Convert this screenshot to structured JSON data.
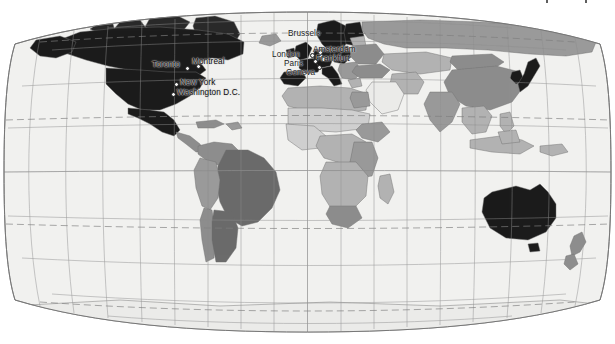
{
  "figure": {
    "type": "world-map",
    "projection": "robinson",
    "title": "",
    "background_color": "#ffffff",
    "ocean_color": "#f1f1ef",
    "graticule_color": "#8e8e8e",
    "tropic_line_color": "#8a8a8a",
    "tropic_line_style": "dashed",
    "outline_color": "#777777",
    "border_color": "#6f6f6f",
    "width": 615,
    "height": 344
  },
  "legend_shades": {
    "highlight_dark": "#1d1d1d",
    "tier_2": "#6b6b6b",
    "tier_3": "#8f8f8f",
    "tier_4": "#b3b3b3",
    "tier_5": "#cfcfcf",
    "tier_6": "#e4e4e2",
    "unshaded": "#f1f1ef"
  },
  "graticule": {
    "meridian_interval_deg": 20,
    "parallel_interval_deg": 20,
    "parallels_deg": [
      80,
      60,
      40,
      20,
      0,
      -20,
      -40,
      -60,
      -80
    ],
    "meridians_deg": [
      -180,
      -160,
      -140,
      -120,
      -100,
      -80,
      -60,
      -40,
      -20,
      0,
      20,
      40,
      60,
      80,
      100,
      120,
      140,
      160,
      180
    ],
    "dashed_parallels": [
      {
        "name": "Arctic Circle",
        "deg": 66.5
      },
      {
        "name": "Tropic of Cancer",
        "deg": 23.5
      },
      {
        "name": "Tropic of Capricorn",
        "deg": -23.5
      },
      {
        "name": "Antarctic Circle",
        "deg": -66.5
      }
    ]
  },
  "cities": [
    {
      "name": "Toronto",
      "label": "Toronto",
      "x": 152,
      "y": 62,
      "dot_x": 185,
      "dot_y": 66,
      "anchor": "start",
      "on": "dark"
    },
    {
      "name": "Montreal",
      "label": "Montreal",
      "x": 190,
      "y": 59,
      "dot_x": 196,
      "dot_y": 64,
      "anchor": "start",
      "on": "dark"
    },
    {
      "name": "New York",
      "label": "New York",
      "x": 178,
      "y": 80,
      "dot_x": 174,
      "dot_y": 83,
      "anchor": "start",
      "on": "dark"
    },
    {
      "name": "Washington D.C.",
      "label": "Washington D.C.",
      "x": 175,
      "y": 90,
      "dot_x": 171,
      "dot_y": 93,
      "anchor": "start",
      "on": "dark"
    },
    {
      "name": "Brussels",
      "label": "Brussels",
      "x": 288,
      "y": 33,
      "dot_x": 318,
      "dot_y": 53,
      "anchor": "start",
      "on": "light"
    },
    {
      "name": "London",
      "label": "London",
      "x": 273,
      "y": 54,
      "dot_x": 310,
      "dot_y": 53,
      "anchor": "start",
      "on": "light"
    },
    {
      "name": "Amsterdam",
      "label": "Amsterdam",
      "x": 314,
      "y": 48,
      "dot_x": 318,
      "dot_y": 50,
      "anchor": "start",
      "on": "dark"
    },
    {
      "name": "Frankfurt",
      "label": "Frankfurt",
      "x": 316,
      "y": 57,
      "dot_x": 321,
      "dot_y": 57,
      "anchor": "start",
      "on": "dark"
    },
    {
      "name": "Paris",
      "label": "Paris",
      "x": 283,
      "y": 63,
      "dot_x": 313,
      "dot_y": 59,
      "anchor": "start",
      "on": "light"
    },
    {
      "name": "Geneva",
      "label": "Geneva",
      "x": 286,
      "y": 72,
      "dot_x": 317,
      "dot_y": 65,
      "anchor": "start",
      "on": "light"
    }
  ],
  "highlighted_regions": [
    "United States",
    "Canada",
    "Mexico",
    "United Kingdom",
    "Ireland",
    "France",
    "Germany",
    "Netherlands",
    "Belgium",
    "Switzerland",
    "Italy",
    "Spain",
    "Portugal",
    "Austria",
    "Czechia",
    "Poland",
    "Denmark",
    "Sweden",
    "Norway",
    "Finland",
    "Japan",
    "South Korea",
    "Australia",
    "Greenland"
  ],
  "accessibility": {
    "alt": "World map in Robinson projection with countries shaded in gray tones; North America, Western Europe, Japan, South Korea and Australia are shaded darkest. Labeled cities: Toronto, Montreal, New York, Washington D.C., London, Brussels, Amsterdam, Frankfurt, Paris, Geneva."
  }
}
